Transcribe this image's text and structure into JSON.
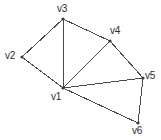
{
  "figure": {
    "kind": "undirected-graph-diagram",
    "background_color": "#ffffff",
    "edge_color": "#4a4a4a",
    "label_color": "#2b2b2b",
    "vertex_color": "#3a3a3a",
    "width": 161,
    "height": 140
  },
  "chart_data": {
    "type": "diagram",
    "title": "",
    "nodes": [
      {
        "id": "v1",
        "label": "v1",
        "x": 63,
        "y": 88,
        "label_x": 51,
        "label_y": 92
      },
      {
        "id": "v2",
        "label": "v2",
        "x": 22,
        "y": 57,
        "label_x": 5,
        "label_y": 51
      },
      {
        "id": "v3",
        "label": "v3",
        "x": 63,
        "y": 19,
        "label_x": 57,
        "label_y": 4
      },
      {
        "id": "v4",
        "label": "v4",
        "x": 110,
        "y": 41,
        "label_x": 110,
        "label_y": 26
      },
      {
        "id": "v5",
        "label": "v5",
        "x": 143,
        "y": 78,
        "label_x": 145,
        "label_y": 71
      },
      {
        "id": "v6",
        "label": "v6",
        "x": 138,
        "y": 123,
        "label_x": 132,
        "label_y": 126
      }
    ],
    "edges": [
      {
        "source": "v2",
        "target": "v3"
      },
      {
        "source": "v2",
        "target": "v1"
      },
      {
        "source": "v3",
        "target": "v1"
      },
      {
        "source": "v3",
        "target": "v4"
      },
      {
        "source": "v4",
        "target": "v1"
      },
      {
        "source": "v4",
        "target": "v5"
      },
      {
        "source": "v1",
        "target": "v5"
      },
      {
        "source": "v1",
        "target": "v6"
      },
      {
        "source": "v5",
        "target": "v6"
      }
    ]
  }
}
